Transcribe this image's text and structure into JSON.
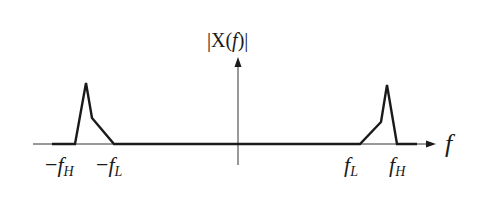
{
  "diagram": {
    "title": "|X(f)|",
    "title_parts": {
      "prefix": "|X(",
      "var": "f",
      "suffix": ")|"
    },
    "x_axis_label": "f",
    "ticks": [
      {
        "id": "neg-fH",
        "sign": "−",
        "base": "f",
        "sub": "H",
        "x": 75
      },
      {
        "id": "neg-fL",
        "sign": "−",
        "base": "f",
        "sub": "L",
        "x": 114
      },
      {
        "id": "fL",
        "sign": "",
        "base": "f",
        "sub": "L",
        "x": 360
      },
      {
        "id": "fH",
        "sign": "",
        "base": "f",
        "sub": "H",
        "x": 397
      }
    ],
    "colors": {
      "line": "#1a1a1a",
      "axis": "#333333",
      "background": "#ffffff"
    }
  }
}
